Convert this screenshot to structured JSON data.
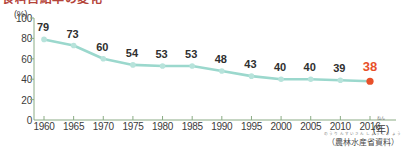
{
  "title": {
    "text": "食料自給率の変化",
    "note": "cut-off at top edge of image"
  },
  "chart_data": {
    "type": "line",
    "title": "",
    "xlabel": "(年)",
    "ylabel": "(%)",
    "categories": [
      "1960",
      "1965",
      "1970",
      "1975",
      "1980",
      "1985",
      "1990",
      "1995",
      "2000",
      "2005",
      "2010",
      "2016"
    ],
    "values": [
      79,
      73,
      60,
      54,
      53,
      53,
      48,
      43,
      40,
      40,
      39,
      38
    ],
    "point_labels": [
      "79",
      "73",
      "60",
      "54",
      "53",
      "53",
      "48",
      "43",
      "40",
      "40",
      "39",
      "38"
    ],
    "highlight_index": 11,
    "ylim": [
      0,
      100
    ],
    "y_ticks": [
      "0",
      "20",
      "40",
      "60",
      "80",
      "100"
    ],
    "y_tick_values": [
      0,
      20,
      40,
      60,
      80,
      100
    ],
    "grid": false,
    "legend": "none",
    "line_color": "#9bd8cd",
    "marker_color": "#b7e3db",
    "highlight_color": "#e8502a",
    "axis_color": "#8aab84",
    "label_color": "#2f2f2f"
  },
  "axis": {
    "y_unit": "(%)",
    "x_unit": "(年)",
    "x_unit_ruby": "ねん"
  },
  "source": {
    "text": "（農林水産省資料）",
    "ruby": "のうりんすいさんしょうしりょう"
  }
}
